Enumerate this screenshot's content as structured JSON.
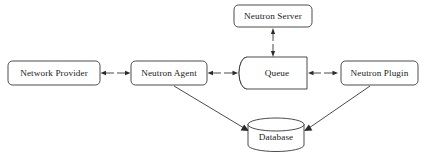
{
  "diagram": {
    "background_color": "#ffffff",
    "stroke_color": "#2b2b2b",
    "text_color": "#1a1a1a",
    "nodes": [
      {
        "id": "network-provider",
        "label": "Network Provider",
        "shape": "rounded-rectangle",
        "x": 8,
        "y": 61,
        "width": 92,
        "height": 24
      },
      {
        "id": "neutron-agent",
        "label": "Neutron Agent",
        "shape": "rounded-rectangle",
        "x": 131,
        "y": 61,
        "width": 76,
        "height": 24
      },
      {
        "id": "neutron-server",
        "label": "Neutron Server",
        "shape": "rounded-rectangle",
        "x": 234,
        "y": 5,
        "width": 78,
        "height": 22
      },
      {
        "id": "queue",
        "label": "Queue",
        "shape": "cylinder-horizontal",
        "x": 239,
        "y": 57,
        "width": 68,
        "height": 32
      },
      {
        "id": "neutron-plugin",
        "label": "Neutron Plugin",
        "shape": "rounded-rectangle",
        "x": 341,
        "y": 61,
        "width": 77,
        "height": 24
      },
      {
        "id": "database",
        "label": "Database",
        "shape": "cylinder-vertical",
        "x": 248,
        "y": 118,
        "width": 56,
        "height": 33
      }
    ],
    "edges": [
      {
        "id": "network-provider-neutron-agent",
        "from": "network-provider",
        "to": "neutron-agent",
        "direction": "bidirectional",
        "orientation": "horizontal"
      },
      {
        "id": "neutron-agent-queue",
        "from": "neutron-agent",
        "to": "queue",
        "direction": "bidirectional",
        "orientation": "horizontal"
      },
      {
        "id": "queue-neutron-plugin",
        "from": "queue",
        "to": "neutron-plugin",
        "direction": "bidirectional",
        "orientation": "horizontal"
      },
      {
        "id": "queue-neutron-server",
        "from": "queue",
        "to": "neutron-server",
        "direction": "bidirectional",
        "orientation": "vertical"
      },
      {
        "id": "neutron-agent-database",
        "from": "neutron-agent",
        "to": "database",
        "direction": "unidirectional",
        "orientation": "diagonal"
      },
      {
        "id": "neutron-plugin-database",
        "from": "neutron-plugin",
        "to": "database",
        "direction": "unidirectional",
        "orientation": "diagonal"
      }
    ]
  }
}
